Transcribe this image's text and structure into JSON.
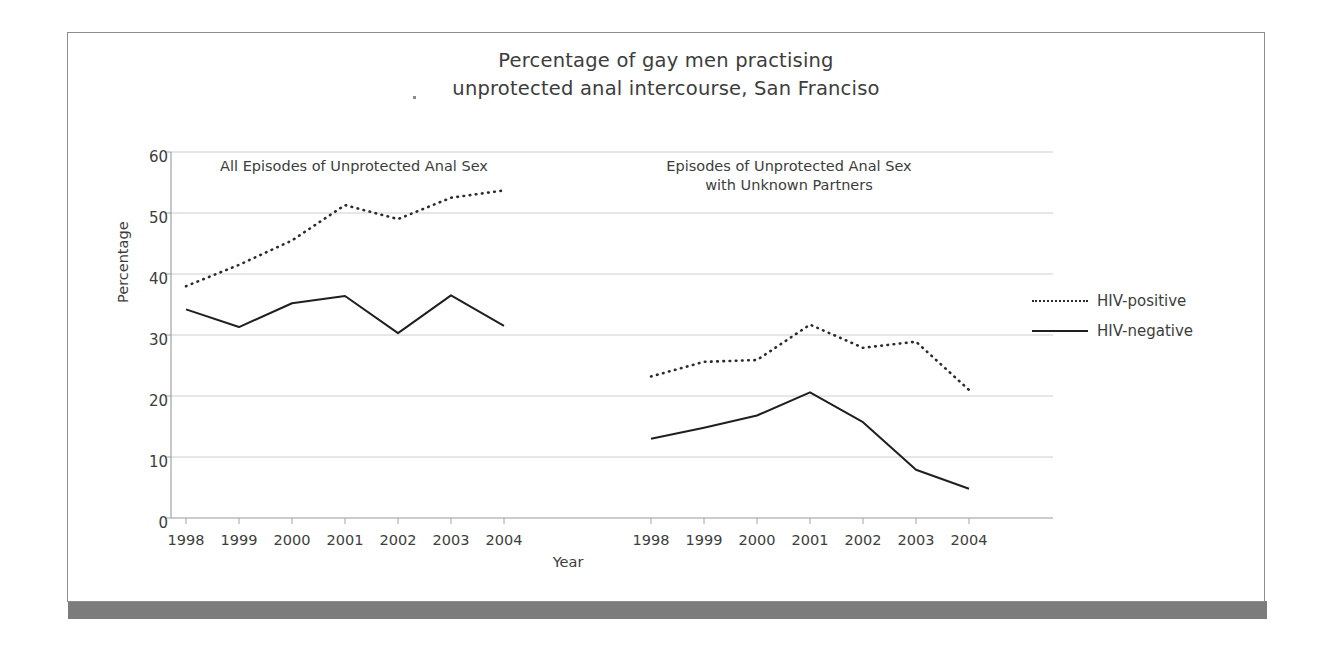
{
  "figure": {
    "title_line1": "Percentage of gay men practising",
    "title_line2": "unprotected anal intercourse, San Franciso",
    "border_color": "#8d8d8d",
    "shadow_color": "#7c7c7c"
  },
  "chart_data": {
    "type": "line",
    "title": "Percentage of gay men practising unprotected anal intercourse, San Franciso",
    "xlabel": "Year",
    "ylabel": "Percentage",
    "ylim": [
      0,
      60
    ],
    "ytick_labels": [
      "60",
      "50",
      "40",
      "30",
      "20",
      "10",
      "0"
    ],
    "ytick_values": [
      60,
      50,
      40,
      30,
      20,
      10,
      0
    ],
    "grid": "horizontal",
    "legend_position": "right",
    "legend": [
      {
        "label": "HIV-positive",
        "style": "dotted"
      },
      {
        "label": "HIV-negative",
        "style": "solid"
      }
    ],
    "panels": [
      {
        "caption": "All Episodes of Unprotected Anal Sex",
        "categories": [
          "1998",
          "1999",
          "2000",
          "2001",
          "2002",
          "2003",
          "2004"
        ],
        "series": [
          {
            "name": "HIV-positive",
            "style": "dotted",
            "values": [
              38,
              41.5,
              45.5,
              51.3,
              49,
              52.5,
              53.7
            ]
          },
          {
            "name": "HIV-negative",
            "style": "solid",
            "values": [
              34.2,
              31.3,
              35.2,
              36.4,
              30.3,
              36.5,
              31.5
            ]
          }
        ]
      },
      {
        "caption_line1": "Episodes of Unprotected Anal Sex",
        "caption_line2": "with Unknown Partners",
        "categories": [
          "1998",
          "1999",
          "2000",
          "2001",
          "2002",
          "2003",
          "2004"
        ],
        "series": [
          {
            "name": "HIV-positive",
            "style": "dotted",
            "values": [
              23.2,
              25.6,
              25.9,
              31.7,
              27.9,
              28.9,
              21
            ]
          },
          {
            "name": "HIV-negative",
            "style": "solid",
            "values": [
              13,
              14.8,
              16.8,
              20.6,
              15.7,
              7.9,
              4.8
            ]
          }
        ]
      }
    ]
  }
}
